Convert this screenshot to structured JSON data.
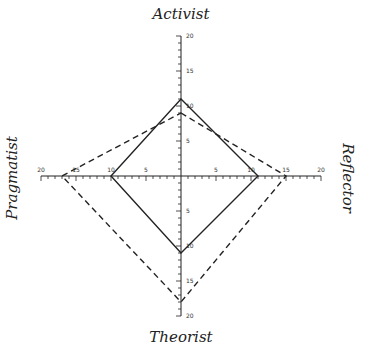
{
  "chart_data": {
    "type": "radar",
    "title": "",
    "axes": [
      "Activist",
      "Reflector",
      "Theorist",
      "Pragmatist"
    ],
    "range": [
      0,
      20
    ],
    "tick_labels": [
      "5",
      "10",
      "15",
      "20"
    ],
    "series": [
      {
        "name": "solid",
        "style": "solid",
        "values": [
          11,
          11,
          11,
          10
        ]
      },
      {
        "name": "dashed",
        "style": "dashed",
        "values": [
          9,
          15,
          18,
          17
        ]
      }
    ],
    "grid": false,
    "legend": "none"
  },
  "labels": {
    "top": "Activist",
    "right": "Reflector",
    "bottom": "Theorist",
    "left": "Pragmatist"
  },
  "ticks": {
    "t5": "5",
    "t10": "10",
    "t15": "15",
    "t20": "20"
  },
  "colors": {
    "line": "#222222"
  }
}
